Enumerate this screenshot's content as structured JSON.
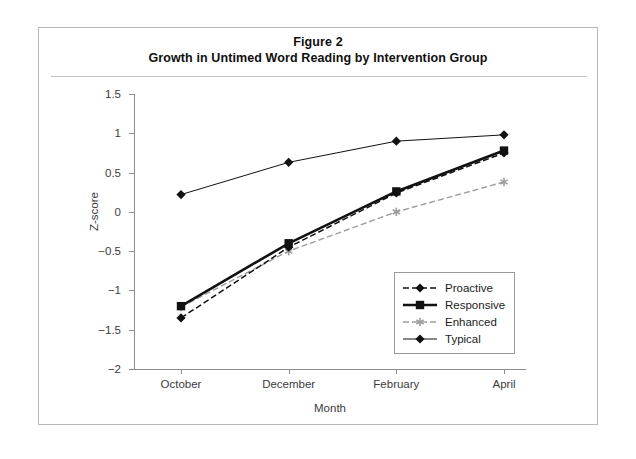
{
  "figure": {
    "title_line1": "Figure 2",
    "title_line2": "Growth in Untimed Word Reading by Intervention Group"
  },
  "axes": {
    "ylabel": "Z-score",
    "xlabel": "Month",
    "y_ticks": [
      "1.5",
      "1",
      "0.5",
      "0",
      "-0.5",
      "-1",
      "-1.5",
      "-2"
    ],
    "x_ticks": [
      "October",
      "December",
      "February",
      "April"
    ]
  },
  "legend": {
    "items": [
      {
        "label": "Proactive",
        "marker": "diamond",
        "style": "dashed",
        "color": "#111111"
      },
      {
        "label": "Responsive",
        "marker": "square",
        "style": "solid-bold",
        "color": "#111111"
      },
      {
        "label": "Enhanced",
        "marker": "asterisk",
        "style": "dashed",
        "color": "#9d9d9d"
      },
      {
        "label": "Typical",
        "marker": "diamond",
        "style": "solid",
        "color": "#111111"
      }
    ]
  },
  "chart_data": {
    "type": "line",
    "xlabel": "Month",
    "ylabel": "Z-score",
    "categories": [
      "October",
      "December",
      "February",
      "April"
    ],
    "ylim": [
      -2,
      1.5
    ],
    "ytick_step": 0.5,
    "grid": false,
    "legend_position": "inside-lower-right",
    "series": [
      {
        "name": "Proactive",
        "values": [
          -1.35,
          -0.45,
          0.24,
          0.75
        ]
      },
      {
        "name": "Responsive",
        "values": [
          -1.2,
          -0.4,
          0.26,
          0.78
        ]
      },
      {
        "name": "Enhanced",
        "values": [
          -1.21,
          -0.5,
          0.0,
          0.38
        ]
      },
      {
        "name": "Typical",
        "values": [
          0.22,
          0.63,
          0.9,
          0.98
        ]
      }
    ]
  }
}
